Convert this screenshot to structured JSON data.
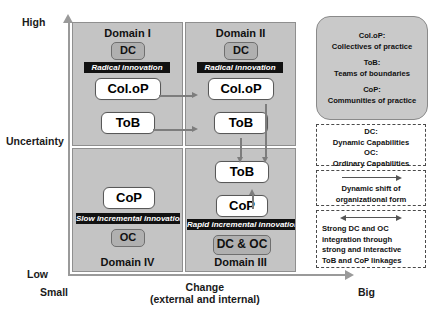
{
  "axes": {
    "y_label": "Uncertainty",
    "y_high": "High",
    "y_low": "Low",
    "x_label_line1": "Change",
    "x_label_line2": "(external and internal)",
    "x_small": "Small",
    "x_big": "Big"
  },
  "quadrants": {
    "domain1": {
      "title": "Domain I",
      "capability": "DC",
      "innovation": "Radical innovation",
      "node_top": "Col.oP",
      "node_bottom": "ToB"
    },
    "domain2": {
      "title": "Domain II",
      "capability": "DC",
      "innovation": "Radical innovation",
      "node_top": "Col.oP",
      "node_bottom": "ToB"
    },
    "domain3": {
      "title": "Domain III",
      "capability": "DC & OC",
      "innovation": "Rapid incremental innovation",
      "node_top": "ToB",
      "node_bottom": "CoP"
    },
    "domain4": {
      "title": "Domain IV",
      "capability": "OC",
      "innovation": "Slow incremental  innovation",
      "node_top": "CoP"
    }
  },
  "legend_terms": {
    "item1_abbr": "Col.oP:",
    "item1_full": "Collectives of practice",
    "item2_abbr": "ToB:",
    "item2_full": "Teams of boundaries",
    "item3_abbr": "CoP:",
    "item3_full": "Communities of practice"
  },
  "legend_capabilities": {
    "dc_abbr": "DC:",
    "dc_full": "Dynamic Capabilities",
    "oc_abbr": "OC:",
    "oc_full": "Ordinary Capabilities"
  },
  "legend_single_arrow": {
    "line1": "Dynamic shift of",
    "line2": "organizational form"
  },
  "legend_double_arrow": {
    "line1": "Strong DC and OC",
    "line2": "integration through",
    "line3": "strong and interactive",
    "line4": "ToB and CoP linkages"
  },
  "colors": {
    "quadrant_fill": "#c4c4c4",
    "chip_fill": "#b0b0b0",
    "banner_fill": "#111111",
    "arrow": "#7d7d7d"
  }
}
